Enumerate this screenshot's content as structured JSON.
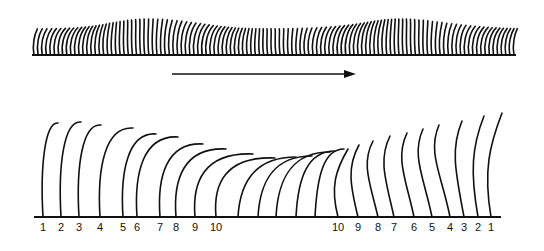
{
  "figure": {
    "colors": {
      "ink": "#111111",
      "background": "#ffffff"
    },
    "top_strip": {
      "baseline": {
        "x1": 32,
        "x2": 516,
        "y": 55
      },
      "cilium_count": 118,
      "wave_crests_x": [
        150,
        400
      ],
      "wave_troughs_x": [
        40,
        265,
        505
      ]
    },
    "arrow": {
      "x1": 172,
      "x2": 356,
      "y": 74,
      "direction": "right-icon"
    },
    "bottom_diagram": {
      "baseline": {
        "x1": 34,
        "x2": 501,
        "y": 217
      },
      "left_sequence": {
        "labels": [
          "1",
          "2",
          "3",
          "4",
          "5",
          "6",
          "7",
          "8",
          "9",
          "10"
        ],
        "label_x": [
          43,
          61,
          79,
          100,
          123,
          137,
          160,
          176,
          195,
          216
        ]
      },
      "middle_cilia_x": [
        238,
        258,
        276,
        296,
        315
      ],
      "right_sequence": {
        "labels": [
          "10",
          "9",
          "8",
          "7",
          "6",
          "5",
          "4",
          "3",
          "2",
          "1"
        ],
        "label_x": [
          338,
          358,
          378,
          394,
          414,
          432,
          450,
          464,
          478,
          491
        ]
      }
    }
  }
}
